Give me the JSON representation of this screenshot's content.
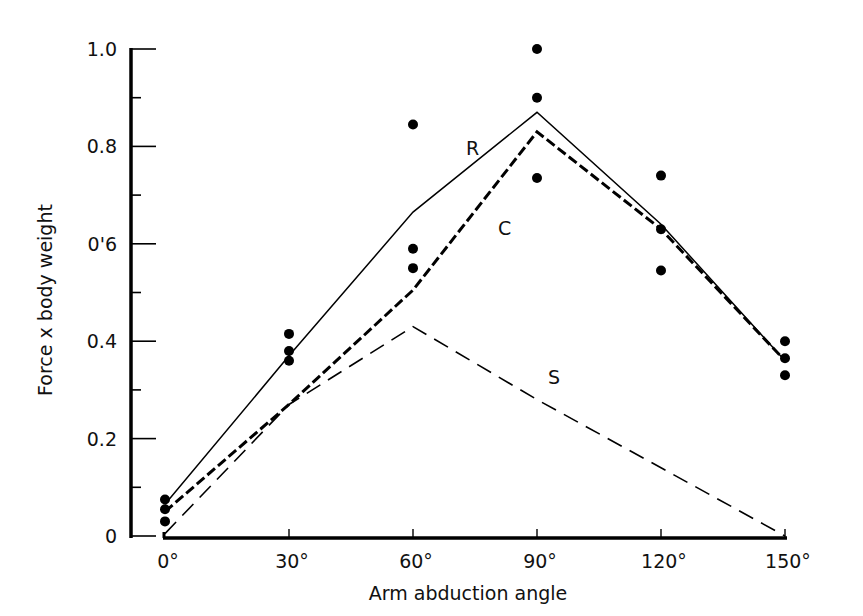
{
  "chart_data": {
    "type": "line",
    "title": "",
    "xlabel": "Arm abduction angle",
    "ylabel": "Force x body weight",
    "x": [
      0,
      30,
      60,
      90,
      120,
      150
    ],
    "x_tick_labels": [
      "0°",
      "30°",
      "60°",
      "90°",
      "120°",
      "150°"
    ],
    "y_tick_labels": [
      "0",
      "0.2",
      "0.4",
      "0'6",
      "0.8",
      "1.0"
    ],
    "y_ticks": [
      0,
      0.2,
      0.4,
      0.6,
      0.8,
      1.0
    ],
    "xlim": [
      0,
      150
    ],
    "ylim": [
      0,
      1.0
    ],
    "grid": false,
    "legend": "inline labels",
    "series": [
      {
        "name": "R",
        "style": "solid-thin",
        "values": [
          0.065,
          0.37,
          0.665,
          0.87,
          0.64,
          0.36
        ],
        "label_pos": {
          "x": 75,
          "y": 0.8
        }
      },
      {
        "name": "C",
        "style": "dashed-heavy",
        "values": [
          0.05,
          0.27,
          0.505,
          0.83,
          0.63,
          0.36
        ],
        "label_pos": {
          "x": 82,
          "y": 0.62
        }
      },
      {
        "name": "S",
        "style": "dashed-long",
        "values": [
          0.005,
          0.27,
          0.43,
          0.28,
          0.14,
          0.0
        ],
        "label_pos": {
          "x": 97,
          "y": 0.32
        }
      }
    ],
    "scatter_points": [
      {
        "x": 0,
        "y": 0.075
      },
      {
        "x": 0,
        "y": 0.055
      },
      {
        "x": 0,
        "y": 0.03
      },
      {
        "x": 30,
        "y": 0.415
      },
      {
        "x": 30,
        "y": 0.38
      },
      {
        "x": 30,
        "y": 0.36
      },
      {
        "x": 60,
        "y": 0.845
      },
      {
        "x": 60,
        "y": 0.59
      },
      {
        "x": 60,
        "y": 0.55
      },
      {
        "x": 90,
        "y": 1.0
      },
      {
        "x": 90,
        "y": 0.9
      },
      {
        "x": 90,
        "y": 0.735
      },
      {
        "x": 120,
        "y": 0.74
      },
      {
        "x": 120,
        "y": 0.63
      },
      {
        "x": 120,
        "y": 0.545
      },
      {
        "x": 150,
        "y": 0.4
      },
      {
        "x": 150,
        "y": 0.365
      },
      {
        "x": 150,
        "y": 0.33
      }
    ]
  },
  "labels": {
    "xlabel": "Arm abduction angle",
    "ylabel": "Force x body weight",
    "series_R": "R",
    "series_C": "C",
    "series_S": "S"
  }
}
